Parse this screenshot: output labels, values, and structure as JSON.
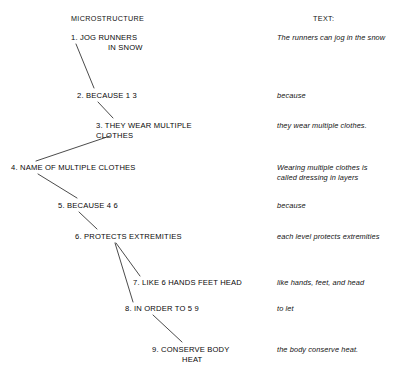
{
  "headers": {
    "left": "MICROSTRUCTURE",
    "right": "TEXT:"
  },
  "style": {
    "line_color": "#2b2b2b",
    "text_color": "#000000",
    "background": "#ffffff"
  },
  "nodes": [
    {
      "id": 1,
      "label_line1": "1. JOG RUNNERS",
      "label_line2": "IN SNOW"
    },
    {
      "id": 2,
      "label_line1": "2. BECAUSE 1 3",
      "label_line2": ""
    },
    {
      "id": 3,
      "label_line1": "3. THEY WEAR MULTIPLE",
      "label_line2": "CLOTHES"
    },
    {
      "id": 4,
      "label_line1": "4. NAME OF MULTIPLE CLOTHES",
      "label_line2": ""
    },
    {
      "id": 5,
      "label_line1": "5. BECAUSE 4 6",
      "label_line2": ""
    },
    {
      "id": 6,
      "label_line1": "6. PROTECTS EXTREMITIES",
      "label_line2": ""
    },
    {
      "id": 7,
      "label_line1": "7. LIKE 6 HANDS FEET HEAD",
      "label_line2": ""
    },
    {
      "id": 8,
      "label_line1": "8. IN ORDER TO 5 9",
      "label_line2": ""
    },
    {
      "id": 9,
      "label_line1": "9. CONSERVE BODY",
      "label_line2": "HEAT"
    }
  ],
  "glosses": [
    {
      "id": 1,
      "line1": "The runners can jog in the snow",
      "line2": ""
    },
    {
      "id": 2,
      "line1": "because",
      "line2": ""
    },
    {
      "id": 3,
      "line1": "they wear multiple clothes.",
      "line2": ""
    },
    {
      "id": 4,
      "line1": "Wearing multiple clothes is",
      "line2": "called dressing in layers"
    },
    {
      "id": 5,
      "line1": "because",
      "line2": ""
    },
    {
      "id": 6,
      "line1": "each level protects extremities",
      "line2": ""
    },
    {
      "id": 7,
      "line1": "like hands, feet, and head",
      "line2": ""
    },
    {
      "id": 8,
      "line1": "to let",
      "line2": ""
    },
    {
      "id": 9,
      "line1": "the body conserve heat.",
      "line2": ""
    }
  ],
  "edges": [
    {
      "from": 1,
      "to": 2
    },
    {
      "from": 2,
      "to": 3
    },
    {
      "from": 4,
      "to": 3
    },
    {
      "from": 4,
      "to": 5
    },
    {
      "from": 5,
      "to": 6
    },
    {
      "from": 6,
      "to": 7
    },
    {
      "from": 6,
      "to": 8
    },
    {
      "from": 8,
      "to": 9
    }
  ]
}
